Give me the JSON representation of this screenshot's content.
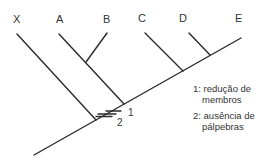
{
  "taxa": [
    {
      "label": "X",
      "x": 13,
      "y": 13
    },
    {
      "label": "A",
      "x": 56,
      "y": 13
    },
    {
      "label": "B",
      "x": 103,
      "y": 13
    },
    {
      "label": "C",
      "x": 138,
      "y": 12
    },
    {
      "label": "D",
      "x": 179,
      "y": 12
    },
    {
      "label": "E",
      "x": 235,
      "y": 12
    }
  ],
  "markers": [
    {
      "id": "1",
      "label": "1"
    },
    {
      "id": "2",
      "label": "2"
    }
  ],
  "legend": [
    {
      "num": "1:",
      "line1": "redução de",
      "line2": "membros"
    },
    {
      "num": "2:",
      "line1": "ausência de",
      "line2": "pálpebras"
    }
  ],
  "colors": {
    "line": "#2a2a2a",
    "text": "#333333"
  }
}
